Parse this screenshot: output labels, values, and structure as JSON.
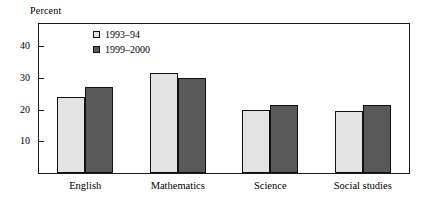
{
  "chart_data": {
    "type": "bar",
    "title": "",
    "xlabel": "",
    "ylabel": "Percent",
    "ylim": [
      0,
      47
    ],
    "yticks": [
      10,
      20,
      30,
      40
    ],
    "ytick_labels": [
      "10",
      "20",
      "30",
      "40"
    ],
    "grid": false,
    "legend_position": "top-left inside plot area",
    "categories": [
      "English",
      "Mathematics",
      "Science",
      "Social studies"
    ],
    "series": [
      {
        "name": "1993–94",
        "color": "#e3e3e3",
        "values": [
          24,
          31.5,
          20,
          19.5
        ]
      },
      {
        "name": "1999–2000",
        "color": "#595959",
        "values": [
          27,
          30,
          21.5,
          21.5
        ]
      }
    ]
  },
  "axis": {
    "y_title": "Percent"
  }
}
